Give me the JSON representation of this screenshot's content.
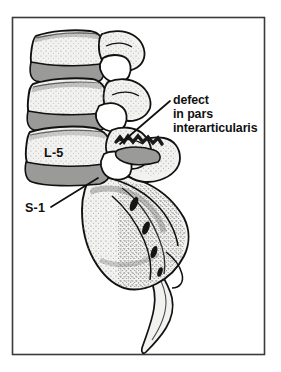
{
  "figure": {
    "frame": {
      "border_color": "#3a3a3a",
      "background_color": "#ffffff",
      "x": 12,
      "y": 17,
      "width": 253,
      "height": 338
    },
    "palette": {
      "bone_fill": "#f2f2f0",
      "bone_outline": "#111111",
      "disc_fill": "#9a9a98",
      "disc_outline": "#111111",
      "facet_fill": "#ffffff",
      "stipple": "#6b6b6b",
      "foramen_fill": "#151515",
      "defect_color": "#1a1a1a",
      "text_color": "#111111",
      "leader_line_color": "#111111"
    },
    "labels": [
      {
        "id": "callout-defect",
        "name": "defect-callout-label",
        "lines": [
          "defect",
          "in pars",
          "interarticularis"
        ],
        "x": 173,
        "y": 104,
        "line_height": 14,
        "leader": {
          "from_x": 170,
          "from_y": 101,
          "to_x": 120,
          "to_y": 144
        }
      },
      {
        "id": "label-l5",
        "name": "l5-vertebra-label",
        "lines": [
          "L-5"
        ],
        "x": 44,
        "y": 157,
        "line_height": 14,
        "leader": null
      },
      {
        "id": "label-s1",
        "name": "s1-sacrum-label",
        "lines": [
          "S-1"
        ],
        "x": 25,
        "y": 212,
        "line_height": 14,
        "leader": {
          "from_x": 51,
          "from_y": 207,
          "to_x": 98,
          "to_y": 178
        }
      }
    ],
    "anatomy": {
      "vertebrae": [
        {
          "name": "L-3 vertebral body",
          "level": "L-3"
        },
        {
          "name": "L-4 vertebral body",
          "level": "L-4"
        },
        {
          "name": "L-5 vertebral body",
          "level": "L-5"
        }
      ],
      "discs": [
        {
          "name": "L3-L4 intervertebral disc"
        },
        {
          "name": "L4-L5 intervertebral disc"
        },
        {
          "name": "L5-S1 intervertebral disc"
        }
      ],
      "sacrum": {
        "name": "sacrum",
        "level": "S-1"
      },
      "coccyx": {
        "name": "coccyx"
      },
      "defect": {
        "name": "pars interarticularis defect"
      }
    }
  }
}
